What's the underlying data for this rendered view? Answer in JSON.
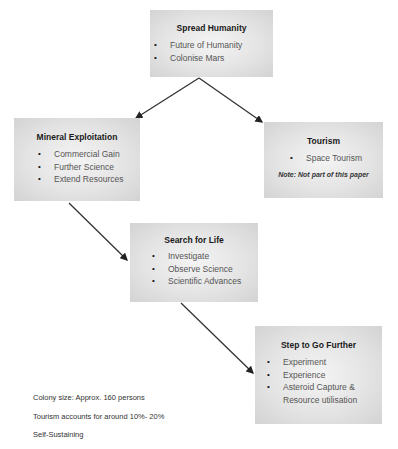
{
  "nodes": [
    {
      "id": "spread-humanity",
      "title": "Spread Humanity",
      "items": [
        "Future of Humanity",
        "Colonise Mars"
      ]
    },
    {
      "id": "mineral-exploitation",
      "title": "Mineral Exploitation",
      "items": [
        "Commercial Gain",
        "Further Science",
        "Extend Resources"
      ]
    },
    {
      "id": "tourism",
      "title": "Tourism",
      "items": [
        "Space Tourism"
      ],
      "note": "Note: Not part of this paper"
    },
    {
      "id": "search-for-life",
      "title": "Search for Life",
      "items": [
        "Investigate",
        "Observe Science",
        "Scientific Advances"
      ]
    },
    {
      "id": "step-to-go-further",
      "title": "Step to Go Further",
      "items": [
        "Experiment",
        "Experience",
        "Asteroid Capture & Resource utilisation"
      ]
    }
  ],
  "edges": [
    {
      "from": "spread-humanity",
      "to": "mineral-exploitation"
    },
    {
      "from": "spread-humanity",
      "to": "tourism"
    },
    {
      "from": "mineral-exploitation",
      "to": "search-for-life"
    },
    {
      "from": "search-for-life",
      "to": "step-to-go-further"
    }
  ],
  "footer": {
    "colony_size": "Colony size: Approx. 160 persons",
    "tourism_share": "Tourism accounts for around 10%- 20%",
    "self_sustaining": "Self-Sustaining"
  },
  "bullet_glyph": "•"
}
